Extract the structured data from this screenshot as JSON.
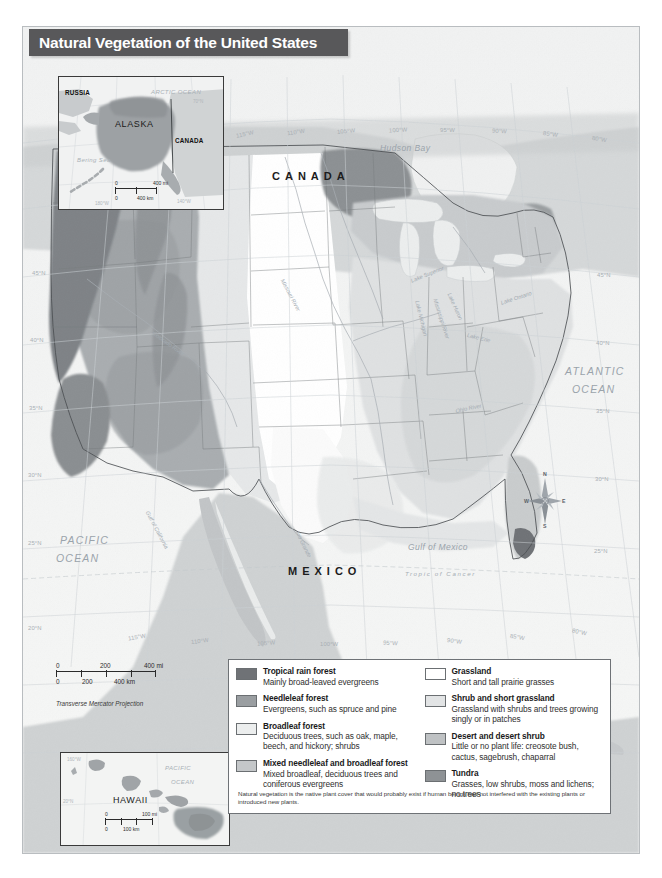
{
  "title": "Natural Vegetation of the United States",
  "projection_note": "Transverse Mercator Projection",
  "legend": {
    "note": "Natural vegetation is the native plant cover that would probably exist if human beings had not interfered with the existing plants or introduced new plants.",
    "left_column": [
      {
        "name": "Tropical rain forest",
        "description": "Mainly broad-leaved evergreens",
        "color": "#6f7276"
      },
      {
        "name": "Needleleaf forest",
        "description": "Evergreens, such as spruce and pine",
        "color": "#9a9ea1"
      },
      {
        "name": "Broadleaf forest",
        "description": "Deciduous trees, such as oak, maple, beech, and hickory; shrubs",
        "color": "#eceeee"
      },
      {
        "name": "Mixed needleleaf and broadleaf forest",
        "description": "Mixed broadleaf, deciduous trees and coniferous evergreens",
        "color": "#c4c7c9"
      }
    ],
    "right_column": [
      {
        "name": "Grassland",
        "description": "Short and tall prairie grasses",
        "color": "#ffffff"
      },
      {
        "name": "Shrub and short grassland",
        "description": "Grassland with shrubs and trees growing singly or in patches",
        "color": "#e2e4e5"
      },
      {
        "name": "Desert and desert shrub",
        "description": "Little or no plant life: creosote bush, cactus, sagebrush, chaparral",
        "color": "#bfc2c4"
      },
      {
        "name": "Tundra",
        "description": "Grasses, low shrubs, moss and lichens; no trees",
        "color": "#8e9295"
      }
    ]
  },
  "scale_main": {
    "mi_labels": [
      "0",
      "200",
      "400 mi"
    ],
    "km_labels": [
      "0",
      "200",
      "400 km"
    ]
  },
  "scale_alaska": {
    "mi_labels": [
      "0",
      "400 mi"
    ],
    "km_labels": [
      "0",
      "400 km"
    ]
  },
  "scale_hawaii": {
    "mi_labels": [
      "0",
      "100 mi"
    ],
    "km_labels": [
      "0",
      "100 km"
    ]
  },
  "map_labels": {
    "countries": [
      "CANADA",
      "MEXICO"
    ],
    "oceans": [
      "PACIFIC OCEAN",
      "ATLANTIC OCEAN"
    ],
    "canada": "CANADA",
    "mexico": "MEXICO",
    "pacific_ocean_1": "PACIFIC",
    "pacific_ocean_2": "OCEAN",
    "atlantic_ocean_1": "ATLANTIC",
    "atlantic_ocean_2": "OCEAN",
    "hudson_bay": "Hudson Bay",
    "gulf_of_mexico": "Gulf  of  Mexico",
    "gulf_of_california": "Gulf of California",
    "tropic_of_cancer": "Tropic  of  Cancer",
    "rio_grande": "Rio Grande",
    "missouri_river": "Missouri River",
    "mississippi_river": "Mississippi River",
    "ohio_river": "Ohio River",
    "colorado_river": "Colorado River",
    "lake_superior": "Lake Superior",
    "lake_michigan": "Lake Michigan",
    "lake_huron": "Lake Huron",
    "lake_erie": "Lake Erie",
    "lake_ontario": "Lake Ontario"
  },
  "graticule": {
    "latitudes_left": [
      "45°N",
      "40°N",
      "35°N",
      "30°N",
      "25°N",
      "20°N"
    ],
    "latitudes_right": [
      "45°N",
      "40°N",
      "35°N",
      "30°N",
      "25°N"
    ],
    "longitudes_top": [
      "115°W",
      "110°W",
      "105°W",
      "100°W",
      "95°W",
      "90°W",
      "85°W",
      "80°W",
      "75°W"
    ],
    "longitudes_bottom": [
      "115°W",
      "110°W",
      "105°W",
      "100°W",
      "95°W",
      "90°W",
      "85°W",
      "80°W"
    ]
  },
  "inset_alaska": {
    "title": "ALASKA",
    "russia": "RUSSIA",
    "canada": "CANADA",
    "arctic_ocean": "ARCTIC OCEAN",
    "bering_sea": "Bering Sea",
    "rio_grande": "Rio Grande",
    "lat_70": "70°N",
    "lon_180": "180°W",
    "lon_160": "160°W",
    "lon_140": "140°W"
  },
  "inset_hawaii": {
    "title": "HAWAII",
    "pacific_1": "PACIFIC",
    "pacific_2": "OCEAN",
    "lon_160": "160°W",
    "lat_20": "20°N"
  },
  "compass": {
    "north": "N",
    "south": "S",
    "east": "E",
    "west": "W"
  }
}
